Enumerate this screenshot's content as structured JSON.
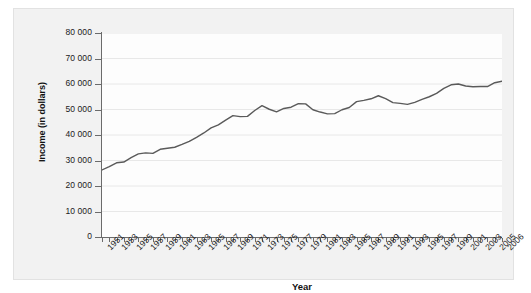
{
  "chart_data": {
    "type": "line",
    "title": "",
    "xlabel": "Year",
    "ylabel": "Income (in dollars)",
    "ylim": [
      0,
      80000
    ],
    "xlim": [
      1951,
      2006
    ],
    "grid": true,
    "legend": "none",
    "y_ticks": [
      "80 000",
      "70 000",
      "60 000",
      "50 000",
      "40 000",
      "30 000",
      "20 000",
      "10 000",
      "0"
    ],
    "y_tick_values": [
      80000,
      70000,
      60000,
      50000,
      40000,
      30000,
      20000,
      10000,
      0
    ],
    "x_tick_labels": [
      "1951",
      "1953",
      "1955",
      "1957",
      "1959",
      "1961",
      "1963",
      "1965",
      "1967",
      "1969",
      "1971",
      "1973",
      "1975",
      "1977",
      "1979",
      "1981",
      "1983",
      "1985",
      "1987",
      "1989",
      "1991",
      "1993",
      "1995",
      "1997",
      "1999",
      "2001",
      "2003",
      "2005",
      "2006"
    ],
    "x": [
      1951,
      1952,
      1953,
      1954,
      1955,
      1956,
      1957,
      1958,
      1959,
      1960,
      1961,
      1962,
      1963,
      1964,
      1965,
      1966,
      1967,
      1968,
      1969,
      1970,
      1971,
      1972,
      1973,
      1974,
      1975,
      1976,
      1977,
      1978,
      1979,
      1980,
      1981,
      1982,
      1983,
      1984,
      1985,
      1986,
      1987,
      1988,
      1989,
      1990,
      1991,
      1992,
      1993,
      1994,
      1995,
      1996,
      1997,
      1998,
      1999,
      2000,
      2001,
      2002,
      2003,
      2004,
      2005,
      2006
    ],
    "values": [
      26300,
      27600,
      29100,
      29400,
      31100,
      32600,
      33000,
      32800,
      34400,
      34800,
      35200,
      36300,
      37500,
      39100,
      40800,
      42800,
      44000,
      45800,
      47600,
      47200,
      47300,
      49600,
      51500,
      50100,
      49100,
      50400,
      50900,
      52300,
      52200,
      49900,
      49000,
      48300,
      48400,
      49900,
      50800,
      53100,
      53600,
      54200,
      55400,
      54300,
      52700,
      52400,
      52000,
      52800,
      54000,
      55000,
      56300,
      58300,
      59700,
      60000,
      59200,
      58900,
      59000,
      59000,
      60500,
      61100
    ],
    "series_note": "Median family income, single unnamed series",
    "line_color": "#5a5a5a"
  },
  "axes": {
    "y_title": "Income (in dollars)",
    "x_title": "Year"
  }
}
